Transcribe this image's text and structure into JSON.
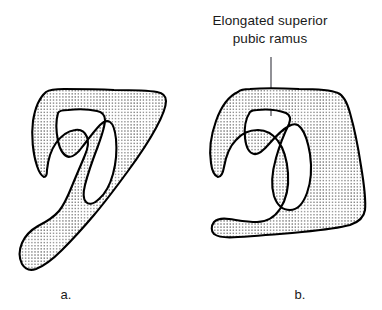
{
  "figure": {
    "background_color": "#ffffff",
    "ink_color": "#000000",
    "stipple_color": "#2b2b2b",
    "leader_color": "#55555e",
    "annotation": {
      "line1": "Elongated superior",
      "line2": "pubic ramus",
      "leader_icon": "leader-line-icon"
    },
    "panels": [
      {
        "id": "a",
        "letter": "a.",
        "caption_x": 66,
        "caption_y": 299,
        "description": "Normal innominate bone - lateral view with short superior pubic ramus"
      },
      {
        "id": "b",
        "letter": "b.",
        "caption_x": 300,
        "caption_y": 299,
        "description": "Innominate bone with elongated superior pubic ramus"
      }
    ]
  }
}
